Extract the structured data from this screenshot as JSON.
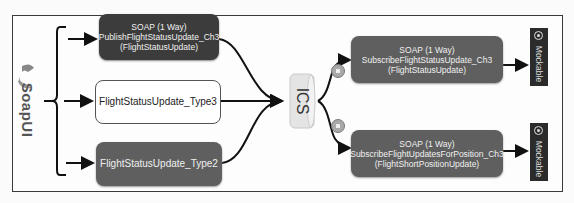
{
  "diagram": {
    "client": {
      "name": "SoapUI",
      "icon": "soapui-logo-icon"
    },
    "sources": [
      {
        "id": "publish",
        "label": "SOAP (1 Way)\nPublishFlightStatusUpdate_Ch3\n(FlightStatusUpdate)",
        "style": "dark"
      },
      {
        "id": "type3",
        "label": "FlightStatusUpdate_Type3",
        "style": "light"
      },
      {
        "id": "type2",
        "label": "FlightStatusUpdate_Type2",
        "style": "mid"
      }
    ],
    "hub": {
      "label": "ICS",
      "icon": "cylinder-icon"
    },
    "targets": [
      {
        "id": "sub-status",
        "label": "SOAP (1 Way)\nSubscribeFlightStatusUpdate_Ch3\n(FlightStatusUpdate)",
        "badge": "filter-icon",
        "mock": "Mockable"
      },
      {
        "id": "sub-position",
        "label": "SOAP (1 Way)\nSubscribeFlightUpdatesForPosition_Ch3\n(FlightShortPositionUpdate)",
        "badge": "filter-icon",
        "mock": "Mockable"
      }
    ],
    "colors": {
      "dark": "#3c3c3c",
      "mid": "#5f5f5f",
      "frame": "#3a3a3a",
      "mock": "#2b2b2b"
    }
  }
}
